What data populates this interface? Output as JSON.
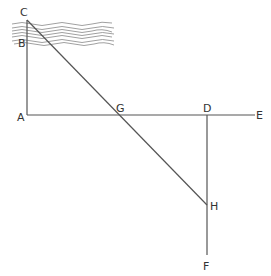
{
  "diagram": {
    "type": "geometric construction (measuring width of a river by similar triangles)",
    "points": {
      "C": {
        "label": "C",
        "x": 27,
        "y": 20
      },
      "B": {
        "label": "B",
        "x": 27,
        "y": 38
      },
      "A": {
        "label": "A",
        "x": 27,
        "y": 115
      },
      "G": {
        "label": "G",
        "x": 117,
        "y": 115
      },
      "D": {
        "label": "D",
        "x": 207,
        "y": 115
      },
      "E": {
        "label": "E",
        "x": 255,
        "y": 115
      },
      "H": {
        "label": "H",
        "x": 207,
        "y": 205
      },
      "F": {
        "label": "F",
        "x": 207,
        "y": 255
      }
    },
    "segments": [
      {
        "from": "C",
        "to": "A"
      },
      {
        "from": "A",
        "to": "E"
      },
      {
        "from": "D",
        "to": "F"
      },
      {
        "from": "C",
        "to": "H"
      }
    ],
    "river": {
      "label": "",
      "description": "wavy water band at top-left between C and B"
    }
  }
}
